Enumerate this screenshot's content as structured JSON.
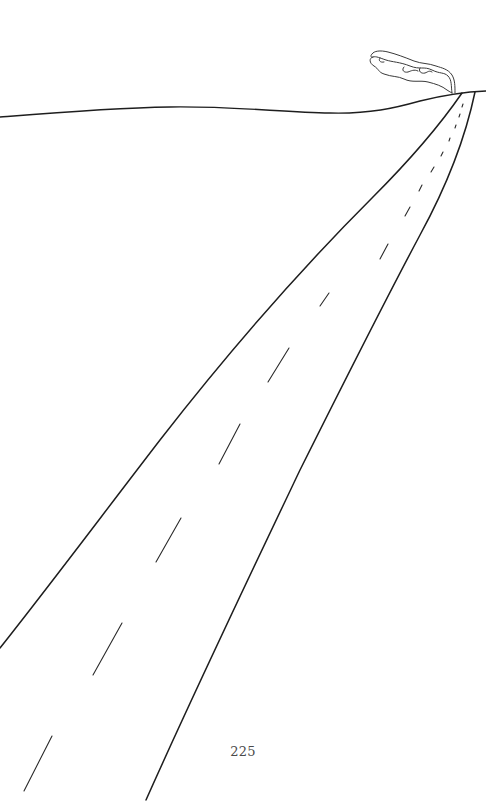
{
  "page": {
    "page_number": "225",
    "background_color": "#ffffff",
    "ink_color": "#1e1e1e"
  },
  "illustration": {
    "subject": "road-to-horizon",
    "elements": [
      {
        "name": "horizon-line"
      },
      {
        "name": "road-left-edge"
      },
      {
        "name": "road-right-edge"
      },
      {
        "name": "road-center-dashes",
        "count": 14
      },
      {
        "name": "smoke-plume"
      }
    ]
  }
}
